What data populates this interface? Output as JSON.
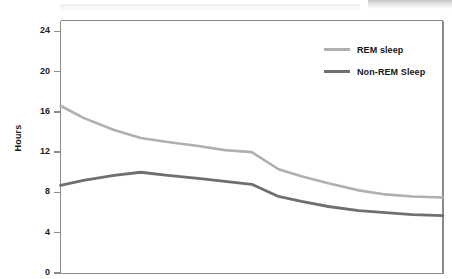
{
  "chart_data": {
    "type": "line",
    "title": "",
    "xlabel": "",
    "ylabel": "Hours",
    "ylim": [
      0,
      25.5
    ],
    "yticks": [
      0,
      4,
      8,
      12,
      16,
      20,
      24
    ],
    "ytick_labels": [
      "0",
      "4",
      "8",
      "12",
      "16",
      "20",
      "24"
    ],
    "xlim": [
      0,
      100
    ],
    "xticks": [],
    "xtick_labels": [],
    "grid": false,
    "legend_position": "upper-right",
    "x": [
      0,
      6,
      14,
      21,
      28,
      36,
      43,
      50,
      57,
      63,
      70,
      78,
      85,
      92,
      100
    ],
    "series": [
      {
        "name": "REM sleep",
        "color": "#b0b0b0",
        "values": [
          16.6,
          15.4,
          14.2,
          13.4,
          13.0,
          12.6,
          12.2,
          12.0,
          10.3,
          9.6,
          8.9,
          8.2,
          7.8,
          7.6,
          7.5
        ]
      },
      {
        "name": "Non-REM Sleep",
        "color": "#6f6f6f",
        "values": [
          8.7,
          9.2,
          9.7,
          10.0,
          9.7,
          9.4,
          9.1,
          8.8,
          7.6,
          7.1,
          6.6,
          6.2,
          6.0,
          5.8,
          5.7
        ]
      }
    ]
  },
  "legend": {
    "items": [
      {
        "label": "REM sleep",
        "color": "#b0b0b0"
      },
      {
        "label": "Non-REM Sleep",
        "color": "#6f6f6f"
      }
    ]
  },
  "axes": {
    "y_title": "Hours"
  },
  "colors": {
    "rem": "#b0b0b0",
    "nonrem": "#6f6f6f",
    "frame": "#8a8a8a",
    "text": "#1c1c1c",
    "background": "#ffffff"
  }
}
